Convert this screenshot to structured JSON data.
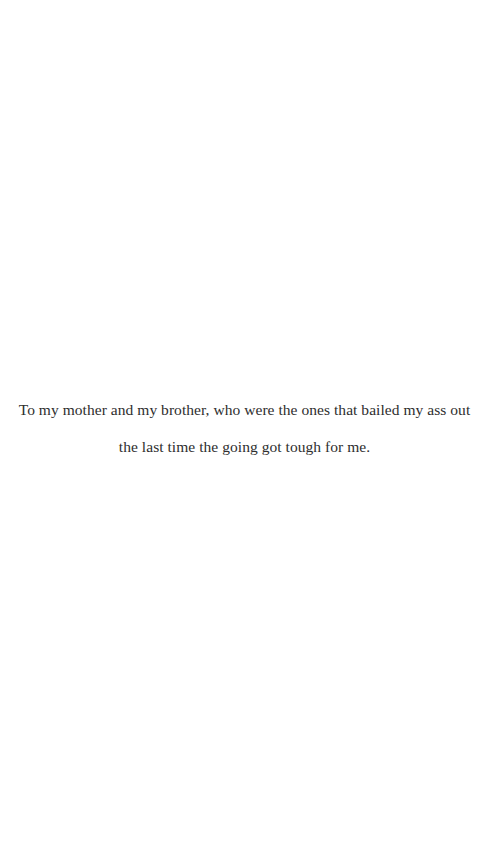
{
  "dedication": {
    "lines": [
      "To my mother and my brother, who were the ones that bailed my ass out",
      "the last time the going got tough for me."
    ]
  },
  "colors": {
    "background": "#ffffff",
    "text": "#2e2e2e"
  }
}
